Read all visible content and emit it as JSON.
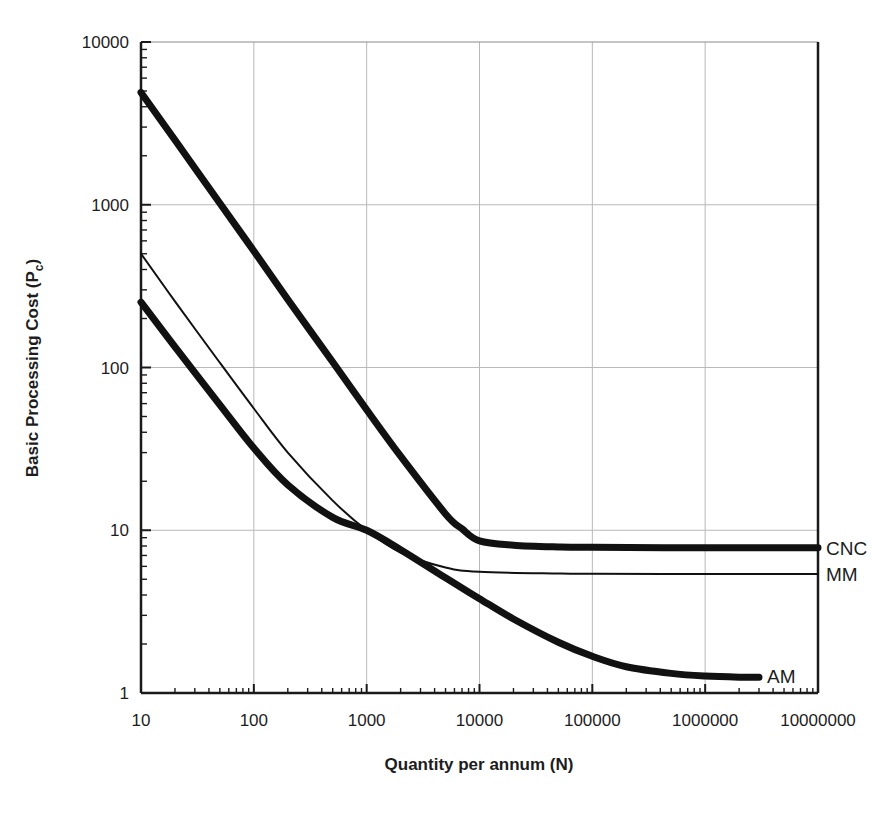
{
  "figure": {
    "background": "#ffffff",
    "line_color": "#111111",
    "grid_color": "#b9b9b9",
    "axis_color": "#1a1a1a"
  },
  "chart_data": {
    "type": "line",
    "title": "",
    "xlabel": "Quantity per annum (N)",
    "ylabel": "Basic Processing Cost (P",
    "ylabel_sub": "c",
    "ylabel_suffix": ")",
    "xscale": "log",
    "yscale": "log",
    "xlim": [
      10,
      10000000
    ],
    "ylim": [
      1,
      10000
    ],
    "grid": "major decades on both axes",
    "legend_position": "inline right of each curve",
    "xticks": [
      10,
      100,
      1000,
      10000,
      100000,
      1000000,
      10000000
    ],
    "xtick_labels": [
      "10",
      "100",
      "1000",
      "10000",
      "100000",
      "1000000",
      "10000000"
    ],
    "yticks": [
      1,
      10,
      100,
      1000,
      10000
    ],
    "ytick_labels": [
      "1",
      "10",
      "100",
      "1000",
      "10000"
    ],
    "series": [
      {
        "name": "CNC",
        "label": "CNC",
        "stroke_width": 7,
        "label_x": 10000000,
        "label_y": 7.8,
        "points": [
          [
            10,
            4900
          ],
          [
            20,
            2500
          ],
          [
            50,
            1020
          ],
          [
            100,
            520
          ],
          [
            200,
            262
          ],
          [
            500,
            108
          ],
          [
            1000,
            55
          ],
          [
            2000,
            28.5
          ],
          [
            5000,
            12.6
          ],
          [
            7000,
            10.2
          ],
          [
            10000,
            8.6
          ],
          [
            20000,
            8.1
          ],
          [
            50000,
            7.9
          ],
          [
            100000,
            7.85
          ],
          [
            1000000,
            7.8
          ],
          [
            10000000,
            7.8
          ]
        ]
      },
      {
        "name": "MM",
        "label": "MM",
        "stroke_width": 2,
        "label_x": 10000000,
        "label_y": 5.4,
        "points": [
          [
            10,
            500
          ],
          [
            20,
            255
          ],
          [
            50,
            107
          ],
          [
            100,
            56
          ],
          [
            200,
            30
          ],
          [
            500,
            15.2
          ],
          [
            1000,
            10.0
          ],
          [
            2000,
            7.3
          ],
          [
            5000,
            5.9
          ],
          [
            10000,
            5.55
          ],
          [
            50000,
            5.42
          ],
          [
            100000,
            5.4
          ],
          [
            1000000,
            5.38
          ],
          [
            10000000,
            5.38
          ]
        ]
      },
      {
        "name": "AM",
        "label": "AM",
        "stroke_width": 7,
        "label_x": 3000000,
        "label_y": 1.27,
        "points": [
          [
            10,
            252
          ],
          [
            20,
            134
          ],
          [
            50,
            59
          ],
          [
            100,
            32
          ],
          [
            200,
            19
          ],
          [
            500,
            12.0
          ],
          [
            1000,
            10.0
          ],
          [
            2000,
            7.6
          ],
          [
            5000,
            5.1
          ],
          [
            10000,
            3.8
          ],
          [
            20000,
            2.85
          ],
          [
            50000,
            2.05
          ],
          [
            100000,
            1.68
          ],
          [
            200000,
            1.45
          ],
          [
            500000,
            1.32
          ],
          [
            1000000,
            1.27
          ],
          [
            2000000,
            1.25
          ],
          [
            3000000,
            1.25
          ]
        ]
      }
    ]
  }
}
